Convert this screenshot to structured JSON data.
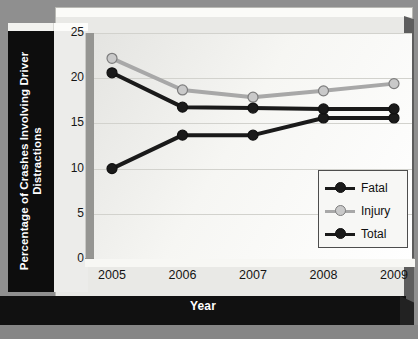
{
  "chart_data": {
    "type": "line",
    "title": "",
    "xlabel": "Year",
    "ylabel": "Percentage of Crashes Involving Driver Distractions",
    "categories": [
      "2005",
      "2006",
      "2007",
      "2008",
      "2009"
    ],
    "x": [
      2005,
      2006,
      2007,
      2008,
      2009
    ],
    "xtick_labels": [
      "2005",
      "2006",
      "2007",
      "2008",
      "2009"
    ],
    "ytick_labels": [
      "0",
      "5",
      "10",
      "15",
      "20",
      "25"
    ],
    "yticks": [
      0,
      5,
      10,
      15,
      20,
      25
    ],
    "ylim": [
      0,
      25
    ],
    "grid": "horizontal",
    "legend_position": "lower-right-inside",
    "series": [
      {
        "name": "Fatal",
        "color": "#1a1a1a",
        "marker_fill": "#1a1a1a",
        "values": [
          10.0,
          13.7,
          13.7,
          15.6,
          15.6
        ]
      },
      {
        "name": "Injury",
        "color": "#a8a8a8",
        "marker_fill": "#c9c9c9",
        "values": [
          22.2,
          18.7,
          17.9,
          18.6,
          19.4
        ]
      },
      {
        "name": "Total",
        "color": "#1a1a1a",
        "marker_fill": "#1a1a1a",
        "values": [
          20.6,
          16.8,
          16.7,
          16.6,
          16.6
        ]
      }
    ]
  },
  "axes": {
    "y_title": "Percentage of Crashes Involving Driver Distractions",
    "x_title": "Year"
  },
  "legend": {
    "items": [
      {
        "label": "Fatal"
      },
      {
        "label": "Injury"
      },
      {
        "label": "Total"
      }
    ]
  },
  "colors": {
    "background": "#8f8f8f",
    "plate": "#e9e9e6",
    "band": "#111111",
    "plot_bg": "#f3f3f0",
    "grid": "#d2d2cd",
    "dark_series": "#1a1a1a",
    "light_series": "#c9c9c9"
  }
}
